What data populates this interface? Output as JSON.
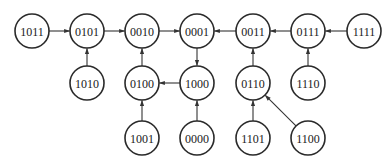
{
  "diagram": {
    "type": "state-transition-graph",
    "radius": 17,
    "colors": {
      "stroke": "#2a2a2a",
      "fill": "#ffffff",
      "text": "#1a1a1a",
      "edge": "#333333"
    },
    "nodes": [
      {
        "id": "1011",
        "label": "1011",
        "x": 32,
        "y": 31
      },
      {
        "id": "0101",
        "label": "0101",
        "x": 87,
        "y": 31
      },
      {
        "id": "0010",
        "label": "0010",
        "x": 142,
        "y": 31
      },
      {
        "id": "0001",
        "label": "0001",
        "x": 197,
        "y": 31
      },
      {
        "id": "0011",
        "label": "0011",
        "x": 253,
        "y": 31
      },
      {
        "id": "0111",
        "label": "0111",
        "x": 308,
        "y": 31
      },
      {
        "id": "1111",
        "label": "1111",
        "x": 364,
        "y": 31
      },
      {
        "id": "1010",
        "label": "1010",
        "x": 87,
        "y": 83
      },
      {
        "id": "0100",
        "label": "0100",
        "x": 142,
        "y": 83
      },
      {
        "id": "1000",
        "label": "1000",
        "x": 197,
        "y": 83
      },
      {
        "id": "0110",
        "label": "0110",
        "x": 253,
        "y": 83
      },
      {
        "id": "1110",
        "label": "1110",
        "x": 308,
        "y": 83
      },
      {
        "id": "1001",
        "label": "1001",
        "x": 142,
        "y": 138
      },
      {
        "id": "0000",
        "label": "0000",
        "x": 197,
        "y": 138
      },
      {
        "id": "1101",
        "label": "1101",
        "x": 253,
        "y": 138
      },
      {
        "id": "1100",
        "label": "1100",
        "x": 308,
        "y": 138
      }
    ],
    "edges": [
      {
        "from": "1011",
        "to": "0101"
      },
      {
        "from": "0101",
        "to": "0010"
      },
      {
        "from": "0010",
        "to": "0001"
      },
      {
        "from": "0011",
        "to": "0001"
      },
      {
        "from": "0111",
        "to": "0011"
      },
      {
        "from": "1111",
        "to": "0111"
      },
      {
        "from": "1010",
        "to": "0101"
      },
      {
        "from": "0100",
        "to": "0010"
      },
      {
        "from": "0001",
        "to": "1000"
      },
      {
        "from": "1000",
        "to": "0100"
      },
      {
        "from": "0110",
        "to": "0011"
      },
      {
        "from": "1110",
        "to": "0111"
      },
      {
        "from": "1001",
        "to": "0100"
      },
      {
        "from": "0000",
        "to": "1000"
      },
      {
        "from": "1101",
        "to": "0110"
      },
      {
        "from": "1100",
        "to": "0110"
      }
    ]
  }
}
